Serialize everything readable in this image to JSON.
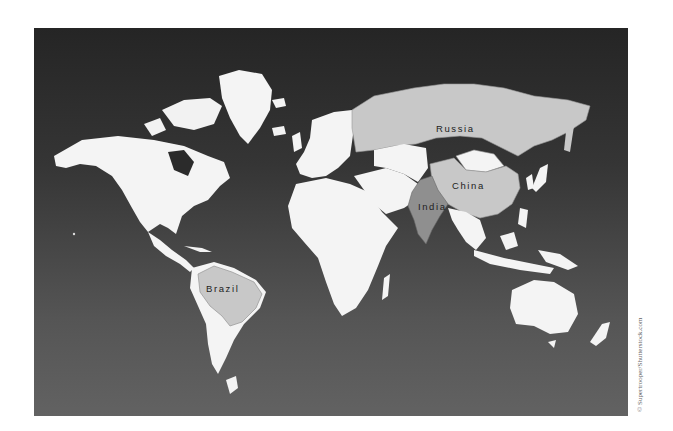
{
  "map": {
    "title": "World map highlighting BRIC countries",
    "colors": {
      "ocean_top": "#252525",
      "ocean_bottom": "#626262",
      "land": "#f4f4f4",
      "highlight_light": "#c8c8c8",
      "highlight_dark": "#8f8f8f"
    },
    "labels": {
      "russia": "Russia",
      "china": "China",
      "india": "India",
      "brazil": "Brazil"
    }
  },
  "credit": "© Supertrooper/Shutterstock.com"
}
